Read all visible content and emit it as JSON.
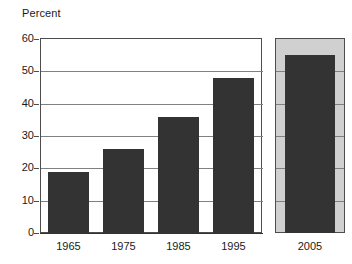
{
  "chart_data": {
    "type": "bar",
    "title": "Percent",
    "xlabel": "",
    "ylabel": "Percent",
    "categories": [
      "1965",
      "1975",
      "1985",
      "1995",
      "2005"
    ],
    "values": [
      19,
      26,
      36,
      48,
      55
    ],
    "ylim": [
      0,
      60
    ],
    "yticks": [
      0,
      10,
      20,
      30,
      40,
      50,
      60
    ],
    "ytick_labels": [
      "0",
      "10",
      "20",
      "30",
      "40",
      "50",
      "60"
    ],
    "grid": true,
    "legend": "none",
    "series": [
      {
        "name": "Percent",
        "values": [
          19,
          26,
          36,
          48,
          55
        ]
      }
    ],
    "annotations": [
      {
        "category": "2005",
        "note": "separate boxed panel with light gray background"
      }
    ],
    "colors": {
      "bar": "#333333",
      "projection_panel_background": "#d0d0d0",
      "gridline": "#808080",
      "frame": "#4d4d4d",
      "text": "#1a1a1a",
      "plot_background": "#ffffff"
    }
  },
  "axis": {
    "title": "Percent"
  }
}
